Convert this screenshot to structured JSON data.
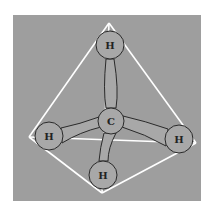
{
  "diagram": {
    "colors": {
      "background": "#ffffff",
      "panel": "#9e9e9e",
      "atom_fill": "#a8a8a8",
      "outline": "#2a2a2a",
      "edge": "#ffffff"
    },
    "atoms": [
      {
        "id": "C",
        "label": "C",
        "x": 111,
        "y": 121
      },
      {
        "id": "H1",
        "label": "H",
        "x": 110,
        "y": 45
      },
      {
        "id": "H2",
        "label": "H",
        "x": 49,
        "y": 136
      },
      {
        "id": "H3",
        "label": "H",
        "x": 179,
        "y": 139
      },
      {
        "id": "H4",
        "label": "H",
        "x": 103,
        "y": 175
      }
    ],
    "tetrahedron_vertices": [
      [
        109,
        23
      ],
      [
        29,
        137
      ],
      [
        196,
        143
      ],
      [
        102,
        193
      ]
    ]
  }
}
